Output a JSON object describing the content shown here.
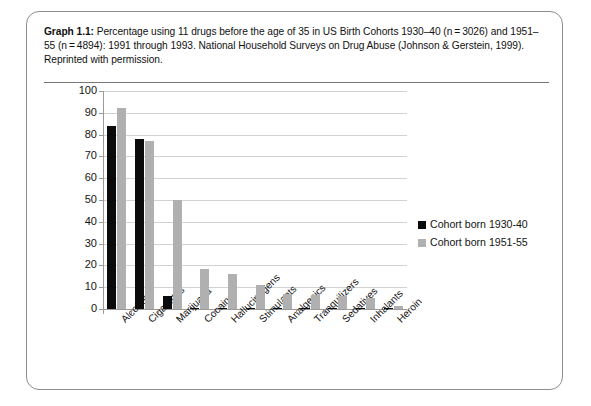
{
  "figure": {
    "caption_lead": "Graph 1.1:",
    "caption_text": " Percentage using 11 drugs before the age of 35 in US Birth Cohorts 1930–40 (n = 3026) and 1951–55 (n = 4894): 1991 through 1993. National Household Surveys on Drug Abuse (Johnson & Gerstein, 1999). Reprinted with permission."
  },
  "chart_data": {
    "type": "bar",
    "title": "",
    "xlabel": "",
    "ylabel": "",
    "ylim": [
      0,
      100
    ],
    "yticks": [
      0,
      10,
      20,
      30,
      40,
      50,
      60,
      70,
      80,
      90,
      100
    ],
    "grid": true,
    "legend_position": "right",
    "categories": [
      "Alcohol",
      "Cigarettes",
      "Marijuana",
      "Cocaine",
      "Hallucinogens",
      "Stimulants",
      "Analgesics",
      "Tranquilizers",
      "Sedatives",
      "Inhalants",
      "Heroin"
    ],
    "series": [
      {
        "name": "Cohort born 1930-40",
        "color": "#0b0b0b",
        "values": [
          84,
          78,
          6,
          0.5,
          0.2,
          0.6,
          0.2,
          0.3,
          0.3,
          0.2,
          0.5
        ]
      },
      {
        "name": "Cohort born 1951-55",
        "color": "#b0b0b0",
        "values": [
          92,
          77,
          50,
          18.5,
          16,
          11,
          7,
          6.5,
          6,
          5,
          1.5
        ]
      }
    ]
  }
}
